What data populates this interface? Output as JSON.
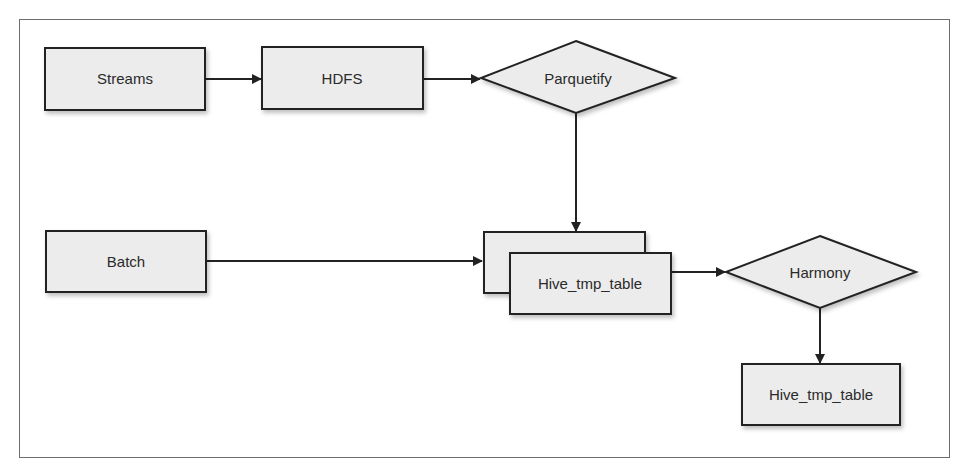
{
  "diagram": {
    "nodes": [
      {
        "id": "streams",
        "label": "Streams",
        "shape": "rect"
      },
      {
        "id": "hdfs",
        "label": "HDFS",
        "shape": "rect"
      },
      {
        "id": "parquetify",
        "label": "Parquetify",
        "shape": "diamond"
      },
      {
        "id": "batch",
        "label": "Batch",
        "shape": "rect"
      },
      {
        "id": "hive_tmp_table_stack",
        "label": "Hive_tmp_table",
        "shape": "stacked-rect"
      },
      {
        "id": "harmony",
        "label": "Harmony",
        "shape": "diamond"
      },
      {
        "id": "hive_tmp_table_out",
        "label": "Hive_tmp_table",
        "shape": "rect"
      }
    ],
    "edges": [
      {
        "from": "streams",
        "to": "hdfs"
      },
      {
        "from": "hdfs",
        "to": "parquetify"
      },
      {
        "from": "parquetify",
        "to": "hive_tmp_table_stack"
      },
      {
        "from": "batch",
        "to": "hive_tmp_table_stack"
      },
      {
        "from": "hive_tmp_table_stack",
        "to": "harmony"
      },
      {
        "from": "harmony",
        "to": "hive_tmp_table_out"
      }
    ],
    "colors": {
      "node_fill": "#ececec",
      "stroke": "#222222",
      "frame": "#6d6d6d"
    }
  }
}
